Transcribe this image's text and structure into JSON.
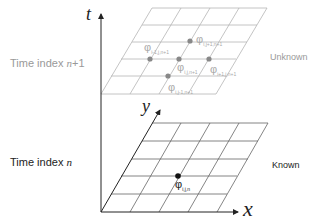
{
  "axes": {
    "t_label": "t",
    "x_label": "x",
    "y_label": "y"
  },
  "layers": {
    "upper": {
      "time_label_prefix": "Time index ",
      "time_label_var": "n",
      "time_label_suffix": "+1",
      "state_label": "Unknown",
      "color": "#aaaaaa",
      "text_color": "#999999",
      "points": [
        {
          "name": "phi-i-j+1-n+1",
          "symbol": "φ",
          "subscript": "i,j+1,n+1"
        },
        {
          "name": "phi-i-1-j-n+1",
          "symbol": "φ",
          "subscript": "i-1,j,n+1"
        },
        {
          "name": "phi-i-j-n+1",
          "symbol": "φ",
          "subscript": "i,j,n+1"
        },
        {
          "name": "phi-i+1-j-n+1",
          "symbol": "φ",
          "subscript": "i+1,j,n+1"
        },
        {
          "name": "phi-i-j-1-n+1",
          "symbol": "φ",
          "subscript": "i,j-1,n+1"
        }
      ]
    },
    "lower": {
      "time_label_prefix": "Time index ",
      "time_label_var": "n",
      "time_label_suffix": "",
      "state_label": "Known",
      "color": "#444444",
      "text_color": "#222222",
      "points": [
        {
          "name": "phi-i-j-n",
          "symbol": "φ",
          "subscript": "i,j,n"
        }
      ]
    }
  }
}
